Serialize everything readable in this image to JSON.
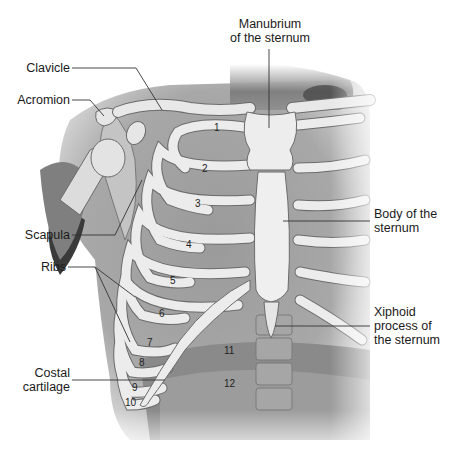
{
  "diagram": {
    "type": "anatomical-illustration",
    "labels": {
      "manubrium": [
        "Manubrium",
        "of the sternum"
      ],
      "clavicle": "Clavicle",
      "acromion": "Acromion",
      "scapula": "Scapula",
      "body_sternum": [
        "Body of the",
        "sternum"
      ],
      "xiphoid": [
        "Xiphoid",
        "process of",
        "the sternum"
      ],
      "ribs": "Ribs",
      "costal_cartilage": [
        "Costal",
        "cartilage"
      ]
    },
    "rib_numbers": [
      "1",
      "2",
      "3",
      "4",
      "5",
      "6",
      "7",
      "8",
      "9",
      "10",
      "11",
      "12"
    ],
    "colors": {
      "background": "#ffffff",
      "bone": "#ebebeb",
      "bone_outline": "#6b6b6b",
      "tissue_dark": "#8a8a8a",
      "tissue_mid": "#b3b3b3",
      "leader_line": "#333333",
      "text": "#1a1a1a"
    }
  }
}
